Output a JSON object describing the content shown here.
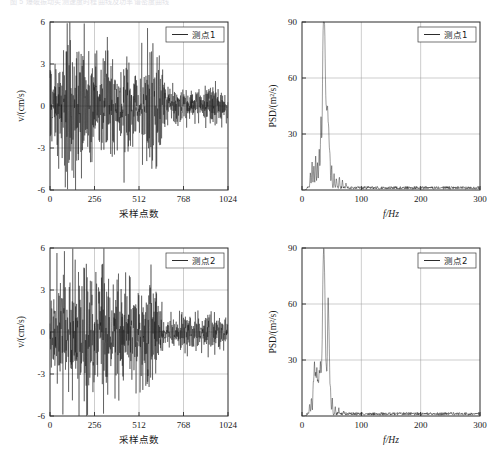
{
  "figure": {
    "cut_caption": "图 5 爆破振动实测速度时程曲线及功率谱密度曲线",
    "width": 504,
    "height": 459,
    "background": "#ffffff",
    "line_color": "#141414",
    "grid_color": "#9a9a9a",
    "frame_color": "#2b2b2b"
  },
  "panels": [
    {
      "id": "panel-top-left",
      "legend": "测点1",
      "x_title": "采样点数",
      "y_title": "v/(cm/s)",
      "x_ticks": [
        "0",
        "256",
        "512",
        "768",
        "1024"
      ],
      "y_ticks": [
        "6",
        "3",
        "0",
        "-3",
        "-6"
      ]
    },
    {
      "id": "panel-top-right",
      "legend": "测点1",
      "x_title": "f/Hz",
      "y_title": "PSD/(m²/s)",
      "x_ticks": [
        "0",
        "100",
        "200",
        "300"
      ],
      "y_ticks": [
        "90",
        "60",
        "30"
      ]
    },
    {
      "id": "panel-bottom-left",
      "legend": "测点2",
      "x_title": "采样点数",
      "y_title": "v/(cm/s)",
      "x_ticks": [
        "0",
        "256",
        "512",
        "768",
        "1024"
      ],
      "y_ticks": [
        "6",
        "3",
        "0",
        "-3",
        "-6"
      ]
    },
    {
      "id": "panel-bottom-right",
      "legend": "测点2",
      "x_title": "f/Hz",
      "y_title": "PSD/(m²/s)",
      "x_ticks": [
        "0",
        "100",
        "200",
        "300"
      ],
      "y_ticks": [
        "90",
        "60",
        "30"
      ]
    }
  ],
  "chart_data": [
    {
      "id": "panel-top-left",
      "type": "line",
      "title": "",
      "xlabel": "采样点数",
      "ylabel": "v/(cm/s)",
      "legend": [
        "测点1"
      ],
      "legend_position": "top-right",
      "grid": true,
      "xlim": [
        0,
        1024
      ],
      "ylim": [
        -6,
        6
      ],
      "xticks": [
        0,
        256,
        512,
        768,
        1024
      ],
      "yticks": [
        -6,
        -3,
        0,
        3,
        6
      ],
      "seed": 1207,
      "n_points": 1024,
      "envelope_note": "blast velocity time history: strong burst 0-300 samples peaks ~5, moderate 300-620 peaks ~4, decaying tail 620-1024 peaks ~1.3",
      "envelope": [
        {
          "x": 0,
          "amp": 2.3
        },
        {
          "x": 40,
          "amp": 3.0
        },
        {
          "x": 90,
          "amp": 4.3
        },
        {
          "x": 140,
          "amp": 4.0
        },
        {
          "x": 180,
          "amp": 5.0
        },
        {
          "x": 215,
          "amp": 4.8
        },
        {
          "x": 250,
          "amp": 4.6
        },
        {
          "x": 275,
          "amp": 2.9
        },
        {
          "x": 300,
          "amp": 1.8
        },
        {
          "x": 320,
          "amp": 4.9
        },
        {
          "x": 345,
          "amp": 3.4
        },
        {
          "x": 380,
          "amp": 2.0
        },
        {
          "x": 430,
          "amp": 2.9
        },
        {
          "x": 470,
          "amp": 2.3
        },
        {
          "x": 520,
          "amp": 2.0
        },
        {
          "x": 560,
          "amp": 3.2
        },
        {
          "x": 590,
          "amp": 4.0
        },
        {
          "x": 620,
          "amp": 3.2
        },
        {
          "x": 645,
          "amp": 2.4
        },
        {
          "x": 670,
          "amp": 1.2
        },
        {
          "x": 720,
          "amp": 1.1
        },
        {
          "x": 780,
          "amp": 1.2
        },
        {
          "x": 850,
          "amp": 1.1
        },
        {
          "x": 930,
          "amp": 1.2
        },
        {
          "x": 1024,
          "amp": 1.1
        }
      ]
    },
    {
      "id": "panel-top-right",
      "type": "line",
      "title": "",
      "xlabel": "f/Hz",
      "ylabel": "PSD/(m²/s)",
      "legend": [
        "测点1"
      ],
      "legend_position": "top-right",
      "grid": true,
      "xlim": [
        0,
        300
      ],
      "ylim": [
        0,
        90
      ],
      "xticks": [
        0,
        100,
        200,
        300
      ],
      "yticks": [
        0,
        30,
        60,
        90
      ],
      "seed": 4471,
      "n_points": 600,
      "peak_note": "single dominant narrow peak near 37 Hz reaching ~82; broadband floor ~1.5 above 70 Hz",
      "peaks": [
        {
          "f": 14,
          "amp": 8
        },
        {
          "f": 17,
          "amp": 14
        },
        {
          "f": 20,
          "amp": 11
        },
        {
          "f": 23,
          "amp": 17
        },
        {
          "f": 26,
          "amp": 13
        },
        {
          "f": 29,
          "amp": 21
        },
        {
          "f": 32,
          "amp": 38
        },
        {
          "f": 35,
          "amp": 46
        },
        {
          "f": 37,
          "amp": 82
        },
        {
          "f": 39,
          "amp": 44
        },
        {
          "f": 41,
          "amp": 34
        },
        {
          "f": 43,
          "amp": 40
        },
        {
          "f": 45,
          "amp": 28
        },
        {
          "f": 47,
          "amp": 18
        },
        {
          "f": 50,
          "amp": 12
        },
        {
          "f": 54,
          "amp": 7
        },
        {
          "f": 58,
          "amp": 5
        },
        {
          "f": 63,
          "amp": 6
        },
        {
          "f": 68,
          "amp": 4
        },
        {
          "f": 74,
          "amp": 2.2
        }
      ],
      "noise_floor": 1.5
    },
    {
      "id": "panel-bottom-left",
      "type": "line",
      "title": "",
      "xlabel": "采样点数",
      "ylabel": "v/(cm/s)",
      "legend": [
        "测点2"
      ],
      "legend_position": "top-right",
      "grid": true,
      "xlim": [
        0,
        1024
      ],
      "ylim": [
        -6,
        6
      ],
      "xticks": [
        0,
        256,
        512,
        768,
        1024
      ],
      "yticks": [
        -6,
        -3,
        0,
        3,
        6
      ],
      "seed": 8893,
      "n_points": 1024,
      "envelope_note": "sustained vibration 0-620 samples with peaks 3-4.7, abrupt decay after 620 to tail peaks ~1.2",
      "envelope": [
        {
          "x": 0,
          "amp": 2.0
        },
        {
          "x": 35,
          "amp": 2.6
        },
        {
          "x": 75,
          "amp": 4.5
        },
        {
          "x": 110,
          "amp": 3.6
        },
        {
          "x": 150,
          "amp": 4.0
        },
        {
          "x": 185,
          "amp": 4.3
        },
        {
          "x": 215,
          "amp": 4.7
        },
        {
          "x": 250,
          "amp": 3.6
        },
        {
          "x": 280,
          "amp": 3.2
        },
        {
          "x": 310,
          "amp": 4.6
        },
        {
          "x": 340,
          "amp": 3.4
        },
        {
          "x": 365,
          "amp": 4.0
        },
        {
          "x": 400,
          "amp": 3.3
        },
        {
          "x": 440,
          "amp": 3.6
        },
        {
          "x": 475,
          "amp": 2.8
        },
        {
          "x": 505,
          "amp": 3.2
        },
        {
          "x": 540,
          "amp": 3.3
        },
        {
          "x": 570,
          "amp": 4.0
        },
        {
          "x": 600,
          "amp": 3.3
        },
        {
          "x": 625,
          "amp": 2.0
        },
        {
          "x": 655,
          "amp": 1.1
        },
        {
          "x": 700,
          "amp": 1.0
        },
        {
          "x": 760,
          "amp": 1.2
        },
        {
          "x": 830,
          "amp": 1.1
        },
        {
          "x": 910,
          "amp": 1.2
        },
        {
          "x": 1024,
          "amp": 1.0
        }
      ]
    },
    {
      "id": "panel-bottom-right",
      "type": "line",
      "title": "",
      "xlabel": "f/Hz",
      "ylabel": "PSD/(m²/s)",
      "legend": [
        "测点2"
      ],
      "legend_position": "top-right",
      "grid": true,
      "xlim": [
        0,
        300
      ],
      "ylim": [
        0,
        90
      ],
      "xticks": [
        0,
        100,
        200,
        300
      ],
      "yticks": [
        0,
        30,
        60,
        90
      ],
      "seed": 2356,
      "n_points": 600,
      "peak_note": "two dominant peaks: ~82 at 37 Hz and ~61 at 44 Hz; cluster of mid peaks 20-35 Hz up to 28; broadband floor ~1.5",
      "peaks": [
        {
          "f": 13,
          "amp": 5
        },
        {
          "f": 16,
          "amp": 9
        },
        {
          "f": 19,
          "amp": 16
        },
        {
          "f": 21,
          "amp": 27
        },
        {
          "f": 23,
          "amp": 19
        },
        {
          "f": 25,
          "amp": 24
        },
        {
          "f": 27,
          "amp": 17
        },
        {
          "f": 29,
          "amp": 22
        },
        {
          "f": 31,
          "amp": 26
        },
        {
          "f": 33,
          "amp": 20
        },
        {
          "f": 35,
          "amp": 42
        },
        {
          "f": 37,
          "amp": 82
        },
        {
          "f": 39,
          "amp": 30
        },
        {
          "f": 41,
          "amp": 22
        },
        {
          "f": 44,
          "amp": 61
        },
        {
          "f": 46,
          "amp": 24
        },
        {
          "f": 48,
          "amp": 13
        },
        {
          "f": 51,
          "amp": 8
        },
        {
          "f": 56,
          "amp": 4
        },
        {
          "f": 62,
          "amp": 3
        },
        {
          "f": 70,
          "amp": 2.0
        }
      ],
      "noise_floor": 1.5
    }
  ]
}
